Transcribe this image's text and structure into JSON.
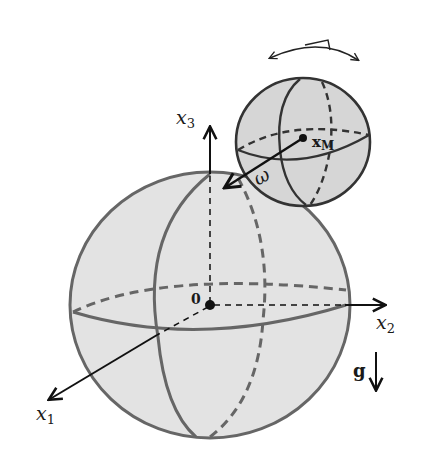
{
  "diagram": {
    "labels": {
      "x1": "x",
      "x1_sub": "1",
      "x2": "x",
      "x2_sub": "2",
      "x3": "x",
      "x3_sub": "3",
      "origin": "0",
      "omega": "ω",
      "xm": "x",
      "xm_sub": "M",
      "gravity": "g"
    },
    "colors": {
      "sphere_fill": "#e3e3e3",
      "sphere_stroke": "#666666",
      "small_sphere_fill": "#d6d6d6",
      "axis": "#111111"
    }
  }
}
